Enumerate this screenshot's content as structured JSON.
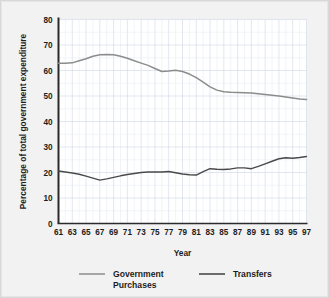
{
  "chart_data": {
    "type": "line",
    "title": "",
    "xlabel": "Year",
    "ylabel": "Percentage of total government expenditure",
    "xlim": [
      61,
      97
    ],
    "ylim": [
      0,
      80
    ],
    "grid": true,
    "legend_position": "bottom",
    "x": [
      61,
      62,
      63,
      64,
      65,
      66,
      67,
      68,
      69,
      70,
      71,
      72,
      73,
      74,
      75,
      76,
      77,
      78,
      79,
      80,
      81,
      82,
      83,
      84,
      85,
      86,
      87,
      88,
      89,
      90,
      91,
      92,
      93,
      94,
      95,
      96,
      97
    ],
    "xtick_labels": [
      "61",
      "63",
      "65",
      "67",
      "69",
      "71",
      "73",
      "75",
      "77",
      "79",
      "81",
      "83",
      "85",
      "87",
      "89",
      "91",
      "93",
      "95",
      "97"
    ],
    "xticks": [
      61,
      63,
      65,
      67,
      69,
      71,
      73,
      75,
      77,
      79,
      81,
      83,
      85,
      87,
      89,
      91,
      93,
      95,
      97
    ],
    "ytick_labels": [
      "0",
      "10",
      "20",
      "30",
      "40",
      "50",
      "60",
      "70",
      "80"
    ],
    "yticks": [
      0,
      10,
      20,
      30,
      40,
      50,
      60,
      70,
      80
    ],
    "series": [
      {
        "name": "Government Purchases",
        "color": "#8c8c8c",
        "values": [
          62.8,
          62.8,
          63.0,
          63.8,
          64.6,
          65.6,
          66.2,
          66.3,
          66.2,
          65.6,
          64.8,
          63.8,
          62.9,
          62.0,
          60.8,
          59.6,
          59.8,
          60.1,
          59.6,
          58.6,
          57.2,
          55.4,
          53.6,
          52.3,
          51.7,
          51.5,
          51.4,
          51.3,
          51.2,
          50.9,
          50.6,
          50.3,
          50.0,
          49.6,
          49.2,
          48.8,
          48.6
        ]
      },
      {
        "name": "Transfers",
        "color": "#4a4a4a",
        "values": [
          20.6,
          20.2,
          19.8,
          19.3,
          18.6,
          17.8,
          17.0,
          17.5,
          18.1,
          18.7,
          19.2,
          19.6,
          20.0,
          20.2,
          20.2,
          20.2,
          20.4,
          19.9,
          19.4,
          19.1,
          19.0,
          20.3,
          21.5,
          21.3,
          21.2,
          21.4,
          21.8,
          21.8,
          21.5,
          22.4,
          23.4,
          24.4,
          25.4,
          25.8,
          25.6,
          25.9,
          26.3
        ]
      }
    ]
  },
  "legend": {
    "entries": [
      {
        "label_line1": "Government",
        "label_line2": "Purchases"
      },
      {
        "label_line1": "Transfers",
        "label_line2": ""
      }
    ]
  }
}
